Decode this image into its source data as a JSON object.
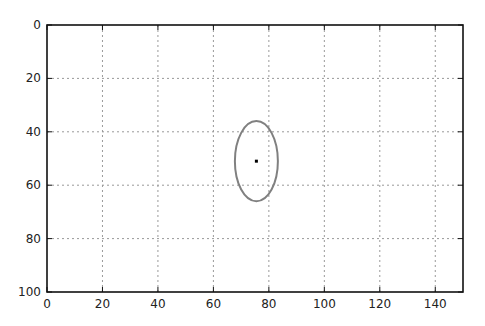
{
  "chart_data": {
    "type": "scatter",
    "title": "",
    "xlabel": "",
    "ylabel": "",
    "xlim": [
      0,
      150
    ],
    "ylim": [
      100,
      0
    ],
    "y_inverted": true,
    "grid": true,
    "x_ticks": [
      0,
      20,
      40,
      60,
      80,
      100,
      120,
      140
    ],
    "y_ticks": [
      0,
      20,
      40,
      60,
      80,
      100
    ],
    "x_tick_labels": [
      "0",
      "20",
      "40",
      "60",
      "80",
      "100",
      "120",
      "140"
    ],
    "y_tick_labels": [
      "0",
      "20",
      "40",
      "60",
      "80",
      "100"
    ],
    "points": [
      {
        "x": 75.5,
        "y": 51,
        "color": "#000000"
      }
    ],
    "shapes": [
      {
        "type": "ellipse",
        "center": [
          75.5,
          51
        ],
        "width": 15.5,
        "height": 30,
        "edge_color": "#808080",
        "fill": "none"
      }
    ],
    "legend": null
  }
}
